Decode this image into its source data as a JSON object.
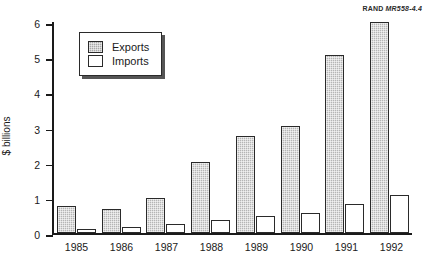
{
  "source_id": {
    "prefix": "RAND",
    "figure": "MR558-4.4"
  },
  "axis": {
    "ylabel": "$ billions",
    "yticks": [
      "0",
      "1",
      "2",
      "3",
      "4",
      "5",
      "6"
    ]
  },
  "legend": {
    "exports_label": "Exports",
    "imports_label": "Imports"
  },
  "chart_data": {
    "type": "bar",
    "title": "",
    "xlabel": "",
    "ylabel": "$ billions",
    "ylim": [
      0,
      6
    ],
    "grid": false,
    "legend_position": "top-left",
    "categories": [
      "1985",
      "1986",
      "1987",
      "1988",
      "1989",
      "1990",
      "1991",
      "1992"
    ],
    "series": [
      {
        "name": "Exports",
        "color": "#b5b5b5",
        "values": [
          0.77,
          0.68,
          1.0,
          2.02,
          2.75,
          3.03,
          5.07,
          6.0
        ]
      },
      {
        "name": "Imports",
        "color": "#ffffff",
        "values": [
          0.1,
          0.18,
          0.25,
          0.37,
          0.47,
          0.57,
          0.82,
          1.07
        ]
      }
    ]
  }
}
